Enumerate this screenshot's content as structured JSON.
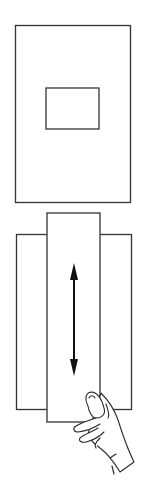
{
  "figure": {
    "top_sheet": {
      "label": "sheet-with-window"
    },
    "bottom_assembly": {
      "label": "sliding-strip-viewer",
      "motion": "vertical"
    },
    "colors": {
      "line": "#333333",
      "background": "#ffffff"
    }
  }
}
